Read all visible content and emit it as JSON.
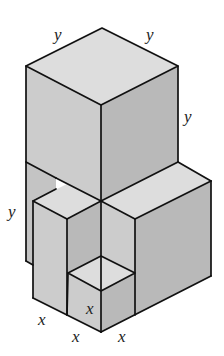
{
  "figure": {
    "colors": {
      "top_face": "#dddddd",
      "left_face": "#cccccc",
      "right_face": "#b9b9b9",
      "edge": "#111111"
    },
    "labels": {
      "top_left_y": "y",
      "top_right_y": "y",
      "right_side_y": "y",
      "left_side_y": "y",
      "bottom_left_x": "x",
      "bottom_middle_x": "x",
      "bottom_right_x": "x",
      "small_cube_x": "x"
    }
  }
}
